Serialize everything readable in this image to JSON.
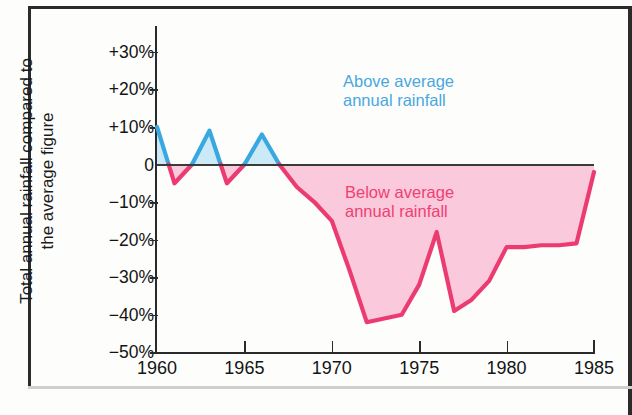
{
  "axis_title": "Total annual rainfall compared to\nthe average figure",
  "y_ticks": [
    {
      "label": "+30%",
      "value": 30
    },
    {
      "label": "+20%",
      "value": 20
    },
    {
      "label": "+10%",
      "value": 10
    },
    {
      "label": "0",
      "value": 0
    },
    {
      "label": "−10%",
      "value": -10
    },
    {
      "label": "−20%",
      "value": -20
    },
    {
      "label": "−30%",
      "value": -30
    },
    {
      "label": "−40%",
      "value": -40
    },
    {
      "label": "−50%",
      "value": -50
    }
  ],
  "x_ticks": [
    {
      "label": "1960",
      "value": 1960
    },
    {
      "label": "1965",
      "value": 1965
    },
    {
      "label": "1970",
      "value": 1970
    },
    {
      "label": "1975",
      "value": 1975
    },
    {
      "label": "1980",
      "value": 1980
    },
    {
      "label": "1985",
      "value": 1985
    }
  ],
  "legend": {
    "above": "Above average\nannual rainfall",
    "below": "Below average\nannual rainfall"
  },
  "colors": {
    "above_line": "#3aa8e0",
    "above_fill": "#cce9f7",
    "below_line": "#ec3b70",
    "below_fill": "#fbc9dc",
    "axis": "#2a2a2a",
    "text": "#141414"
  },
  "chart_data": {
    "type": "area",
    "title": "",
    "xlabel": "",
    "ylabel": "Total annual rainfall compared to the average figure",
    "xlim": [
      1960,
      1985
    ],
    "ylim": [
      -50,
      30
    ],
    "grid": false,
    "legend_position": "inside",
    "units": "percent deviation from average annual rainfall",
    "x": [
      1960,
      1961,
      1962,
      1963,
      1964,
      1965,
      1966,
      1967,
      1968,
      1969,
      1970,
      1971,
      1972,
      1973,
      1974,
      1975,
      1976,
      1977,
      1978,
      1979,
      1980,
      1981,
      1982,
      1983,
      1984,
      1985
    ],
    "values": [
      10,
      -5,
      0,
      9,
      -5,
      0,
      8,
      0,
      -6,
      -10,
      -15,
      -28,
      -42,
      -41,
      -40,
      -32,
      -18,
      -39,
      -36,
      -31,
      -22,
      -22,
      -21.5,
      -21.5,
      -21,
      -2
    ],
    "series": [
      {
        "name": "Annual rainfall deviation",
        "values": [
          10,
          -5,
          0,
          9,
          -5,
          0,
          8,
          0,
          -6,
          -10,
          -15,
          -28,
          -42,
          -41,
          -40,
          -32,
          -18,
          -39,
          -36,
          -31,
          -22,
          -22,
          -21.5,
          -21.5,
          -21,
          -2
        ]
      }
    ],
    "annotations": [
      {
        "text": "Above average annual rainfall",
        "x": 1974,
        "y": 22
      },
      {
        "text": "Below average annual rainfall",
        "x": 1975,
        "y": -6
      }
    ]
  }
}
